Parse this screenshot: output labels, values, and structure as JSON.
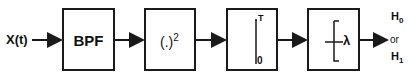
{
  "diagram": {
    "input_label": "X(t)",
    "blocks": [
      {
        "id": "bpf",
        "label": "BPF"
      },
      {
        "id": "square",
        "label": "(.)",
        "superscript": "2"
      },
      {
        "id": "integrator",
        "upper_limit": "T",
        "lower_limit": "0"
      },
      {
        "id": "threshold",
        "label": "λ"
      }
    ],
    "outputs": {
      "h0": "H",
      "h0_sub": "0",
      "or": "or",
      "h1": "H",
      "h1_sub": "1"
    }
  }
}
